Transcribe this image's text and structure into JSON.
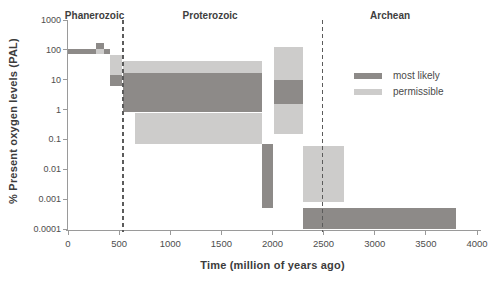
{
  "figure": {
    "y_axis_title": "% Present oxygen levels (PAL)",
    "x_axis_title": "Time (million of years ago)"
  },
  "colors": {
    "most_likely": "#8d8a88",
    "permissible": "#cdcccb",
    "axis": "#9a9a9a",
    "tick_text": "#4d4d4d",
    "label_text": "#3e3e3e",
    "dashed_line": "#5b5b5b"
  },
  "legend": {
    "items": [
      {
        "key": "most_likely",
        "label": "most likely"
      },
      {
        "key": "permissible",
        "label": "permissible"
      }
    ]
  },
  "chart_data": {
    "type": "bar",
    "subtype": "time-range-boxes-log-y",
    "title": "",
    "xlabel": "Time (million of years ago)",
    "ylabel": "% Present oxygen levels (PAL)",
    "y_scale": "log",
    "grid": false,
    "legend_position": "inside-top-right",
    "x_range_ma": [
      0,
      4000
    ],
    "y_range_pal": [
      0.0001,
      1000
    ],
    "x_ticks": [
      0,
      500,
      1000,
      1500,
      2000,
      2500,
      3000,
      3500,
      4000
    ],
    "y_ticks": [
      "1000",
      "100",
      "10",
      "1",
      "0.1",
      "0.01",
      "0.001",
      "0.0001"
    ],
    "eons": [
      {
        "label": "Phanerozoic",
        "start_ma": 0,
        "end_ma": 540,
        "label_ma": 260
      },
      {
        "label": "Proterozoic",
        "start_ma": 540,
        "end_ma": 2490,
        "label_ma": 1390
      },
      {
        "label": "Archean",
        "start_ma": 2490,
        "end_ma": 4000,
        "label_ma": 3150
      }
    ],
    "eon_boundaries_ma": [
      540,
      2490
    ],
    "segments": [
      {
        "t_start": 0,
        "t_end": 270,
        "pal_min": 70,
        "pal_max": 110,
        "kind": "most_likely"
      },
      {
        "t_start": 270,
        "t_end": 350,
        "pal_min": 110,
        "pal_max": 170,
        "kind": "most_likely"
      },
      {
        "t_start": 270,
        "t_end": 350,
        "pal_min": 70,
        "pal_max": 110,
        "kind": "permissible"
      },
      {
        "t_start": 350,
        "t_end": 410,
        "pal_min": 70,
        "pal_max": 110,
        "kind": "most_likely"
      },
      {
        "t_start": 410,
        "t_end": 530,
        "pal_min": 15,
        "pal_max": 70,
        "kind": "permissible"
      },
      {
        "t_start": 410,
        "t_end": 530,
        "pal_min": 6,
        "pal_max": 15,
        "kind": "most_likely"
      },
      {
        "t_start": 540,
        "t_end": 1900,
        "pal_min": 17,
        "pal_max": 42,
        "kind": "permissible"
      },
      {
        "t_start": 540,
        "t_end": 1900,
        "pal_min": 0.8,
        "pal_max": 17,
        "kind": "most_likely"
      },
      {
        "t_start": 650,
        "t_end": 1900,
        "pal_min": 0.07,
        "pal_max": 0.8,
        "kind": "permissible"
      },
      {
        "t_start": 1900,
        "t_end": 2010,
        "pal_min": 0.0005,
        "pal_max": 0.07,
        "kind": "most_likely"
      },
      {
        "t_start": 2010,
        "t_end": 2300,
        "pal_min": 10,
        "pal_max": 125,
        "kind": "permissible"
      },
      {
        "t_start": 2010,
        "t_end": 2300,
        "pal_min": 1.5,
        "pal_max": 10,
        "kind": "most_likely"
      },
      {
        "t_start": 2010,
        "t_end": 2300,
        "pal_min": 0.15,
        "pal_max": 1.5,
        "kind": "permissible"
      },
      {
        "t_start": 2300,
        "t_end": 2700,
        "pal_min": 0.0008,
        "pal_max": 0.06,
        "kind": "permissible"
      },
      {
        "t_start": 2300,
        "t_end": 3790,
        "pal_min": 0.0001,
        "pal_max": 0.0005,
        "kind": "most_likely"
      }
    ]
  }
}
